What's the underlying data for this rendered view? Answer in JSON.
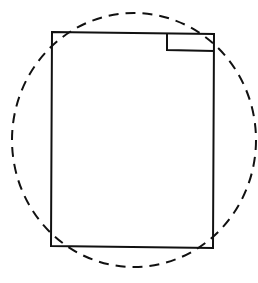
{
  "diagram": {
    "canvas": {
      "width": 258,
      "height": 283,
      "background": "#ffffff"
    },
    "stroke_color": "#111111",
    "outer_rectangle": {
      "x1": 51,
      "y1": 32,
      "x2": 214,
      "y2": 248,
      "stroke_width": 2
    },
    "corner_rectangle": {
      "x1": 166,
      "y1": 33,
      "x2": 214,
      "y2": 50,
      "stroke_width": 2
    },
    "dashed_ellipse": {
      "cx": 134,
      "cy": 140,
      "rx": 122,
      "ry": 127,
      "stroke_width": 2,
      "dash": "10,7"
    }
  }
}
